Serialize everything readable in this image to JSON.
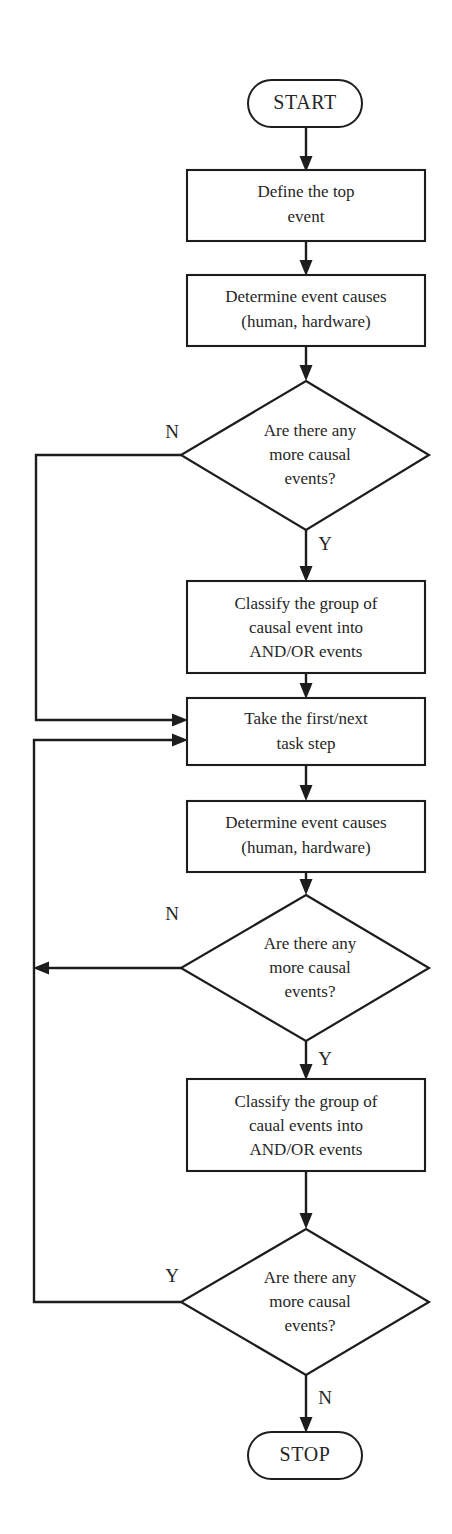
{
  "diagram": {
    "type": "flowchart",
    "background_color": "#ffffff",
    "line_color": "#1d1d1d",
    "text_color": "#262626",
    "nodes": [
      {
        "id": "start",
        "shape": "terminator",
        "label": "START",
        "lines": [
          "START"
        ],
        "x": 305,
        "y": 103,
        "width": 114,
        "height": 47
      },
      {
        "id": "define-top-event",
        "shape": "process",
        "label": "Define the top event",
        "lines": [
          "Define the top",
          "event"
        ],
        "x": 306,
        "y": 205,
        "width": 238,
        "height": 71
      },
      {
        "id": "determine-causes-1",
        "shape": "process",
        "label": "Determine event causes (human, hardware)",
        "lines": [
          "Determine event causes",
          "(human, hardware)"
        ],
        "x": 306,
        "y": 310,
        "width": 238,
        "height": 71
      },
      {
        "id": "decision-causal-1",
        "shape": "decision",
        "label": "Are there any more causal events?",
        "lines": [
          "Are there any",
          "more causal",
          "events?"
        ],
        "x": 306,
        "y": 455,
        "width": 250,
        "height": 150
      },
      {
        "id": "classify-1",
        "shape": "process",
        "label": "Classify the group of causal event into AND/OR events",
        "lines": [
          "Classify the group of",
          "causal event into",
          "AND/OR events"
        ],
        "x": 306,
        "y": 627,
        "width": 238,
        "height": 92
      },
      {
        "id": "take-task-step",
        "shape": "process",
        "label": "Take the first/next task step",
        "lines": [
          "Take the first/next",
          "task step"
        ],
        "x": 306,
        "y": 731,
        "width": 238,
        "height": 67
      },
      {
        "id": "determine-causes-2",
        "shape": "process",
        "label": "Determine event causes (human, hardware)",
        "lines": [
          "Determine event causes",
          "(human, hardware)"
        ],
        "x": 306,
        "y": 836,
        "width": 238,
        "height": 71
      },
      {
        "id": "decision-causal-2",
        "shape": "decision",
        "label": "Are there any more causal events?",
        "lines": [
          "Are there any",
          "more causal",
          "events?"
        ],
        "x": 306,
        "y": 968,
        "width": 250,
        "height": 146
      },
      {
        "id": "classify-2",
        "shape": "process",
        "label": "Classify the group of caual events into AND/OR events",
        "lines": [
          "Classify the group of",
          "caual events into",
          "AND/OR events"
        ],
        "x": 306,
        "y": 1125,
        "width": 238,
        "height": 92
      },
      {
        "id": "decision-causal-3",
        "shape": "decision",
        "label": "Are there any more causal events?",
        "lines": [
          "Are there any",
          "more causal",
          "events?"
        ],
        "x": 306,
        "y": 1302,
        "width": 250,
        "height": 146
      },
      {
        "id": "stop",
        "shape": "terminator",
        "label": "STOP",
        "lines": [
          "STOP"
        ],
        "x": 305,
        "y": 1455,
        "width": 114,
        "height": 47
      }
    ],
    "branch_labels": [
      {
        "id": "branch-1-no",
        "text": "N",
        "x": 172,
        "y": 434,
        "from": "decision-causal-1",
        "direction": "left"
      },
      {
        "id": "branch-1-yes",
        "text": "Y",
        "x": 325,
        "y": 546,
        "from": "decision-causal-1",
        "direction": "down"
      },
      {
        "id": "branch-2-no",
        "text": "N",
        "x": 172,
        "y": 916,
        "from": "decision-causal-2",
        "direction": "left"
      },
      {
        "id": "branch-2-yes",
        "text": "Y",
        "x": 325,
        "y": 1061,
        "from": "decision-causal-2",
        "direction": "down"
      },
      {
        "id": "branch-3-yes",
        "text": "Y",
        "x": 172,
        "y": 1278,
        "from": "decision-causal-3",
        "direction": "left"
      },
      {
        "id": "branch-3-no",
        "text": "N",
        "x": 325,
        "y": 1400,
        "from": "decision-causal-3",
        "direction": "down"
      }
    ],
    "edges": [
      {
        "id": "edge-start-define",
        "from": "start",
        "to": "define-top-event",
        "label": ""
      },
      {
        "id": "edge-define-determine1",
        "from": "define-top-event",
        "to": "determine-causes-1",
        "label": ""
      },
      {
        "id": "edge-determine1-dec1",
        "from": "determine-causes-1",
        "to": "decision-causal-1",
        "label": ""
      },
      {
        "id": "edge-dec1-classify1",
        "from": "decision-causal-1",
        "to": "classify-1",
        "label": "Y"
      },
      {
        "id": "edge-dec1-take",
        "from": "decision-causal-1",
        "to": "take-task-step",
        "label": "N"
      },
      {
        "id": "edge-classify1-take",
        "from": "classify-1",
        "to": "take-task-step",
        "label": ""
      },
      {
        "id": "edge-take-determine2",
        "from": "take-task-step",
        "to": "determine-causes-2",
        "label": ""
      },
      {
        "id": "edge-determine2-dec2",
        "from": "determine-causes-2",
        "to": "decision-causal-2",
        "label": ""
      },
      {
        "id": "edge-dec2-classify2",
        "from": "decision-causal-2",
        "to": "classify-2",
        "label": "Y"
      },
      {
        "id": "edge-dec2-loop",
        "from": "decision-causal-2",
        "to": "take-task-step",
        "label": "N"
      },
      {
        "id": "edge-classify2-dec3",
        "from": "classify-2",
        "to": "decision-causal-3",
        "label": ""
      },
      {
        "id": "edge-dec3-take",
        "from": "decision-causal-3",
        "to": "take-task-step",
        "label": "Y"
      },
      {
        "id": "edge-dec3-stop",
        "from": "decision-causal-3",
        "to": "stop",
        "label": "N"
      }
    ]
  }
}
